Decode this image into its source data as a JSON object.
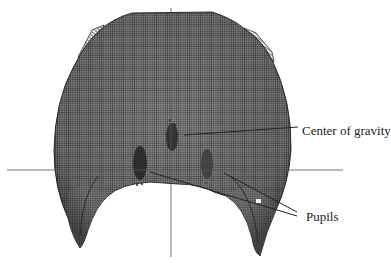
{
  "figure": {
    "type": "3d-wireframe-mesh",
    "colors": {
      "mesh_dark": "#3a3a3a",
      "mesh_mid": "#6e6e6e",
      "mesh_light": "#9a9a9a",
      "point_cluster": "#2a2a2a",
      "axis_line": "#555555",
      "leader_line": "#222222",
      "background": "#ffffff"
    },
    "axes": {
      "horizontal": {
        "x1": 7,
        "x2": 343,
        "y": 170
      },
      "vertical": {
        "x": 171,
        "y1": 8,
        "y2": 257
      }
    }
  },
  "annotations": {
    "center_of_gravity": {
      "label": "Center of gravity"
    },
    "pupils": {
      "label": "Pupils"
    }
  }
}
